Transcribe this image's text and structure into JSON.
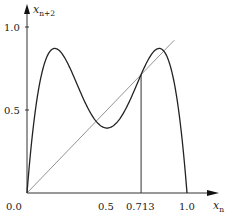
{
  "chart_data": {
    "type": "line",
    "title": "",
    "xlabel": "x_n",
    "ylabel": "x_{n+2}",
    "xlim": [
      0,
      1.1
    ],
    "ylim": [
      0,
      1.05
    ],
    "grid": false,
    "legend": null,
    "x_ticks": [
      {
        "value": 0.0,
        "label": "0.0"
      },
      {
        "value": 0.5,
        "label": "0.5"
      },
      {
        "value": 0.713,
        "label": "0.713"
      },
      {
        "value": 1.0,
        "label": "1.0"
      }
    ],
    "y_ticks": [
      {
        "value": 0.5,
        "label": "0.5"
      },
      {
        "value": 1.0,
        "label": "1.0"
      }
    ],
    "series": [
      {
        "name": "second iterate f(f(x_n))",
        "style": "solid-dark",
        "x": [
          0,
          0.05,
          0.1,
          0.15,
          0.2,
          0.25,
          0.3,
          0.35,
          0.4,
          0.45,
          0.5,
          0.55,
          0.6,
          0.65,
          0.7,
          0.75,
          0.8,
          0.85,
          0.9,
          0.95,
          1.0
        ],
        "values": [
          0,
          0.4812,
          0.75,
          0.8603,
          0.8595,
          0.7892,
          0.684,
          0.5725,
          0.4772,
          0.4135,
          0.3915,
          0.4135,
          0.4772,
          0.5725,
          0.684,
          0.7892,
          0.8595,
          0.8603,
          0.75,
          0.4812,
          0
        ]
      },
      {
        "name": "diagonal x_{n+2} = x_n",
        "style": "thin-gray",
        "x": [
          0,
          0.92
        ],
        "values": [
          0,
          0.92
        ]
      }
    ],
    "annotations": [
      {
        "type": "vertical-line",
        "x": 0.713,
        "from_y": 0,
        "to_y": 0.713,
        "label": "0.713"
      }
    ],
    "parameter_r": 3.4843
  },
  "labels": {
    "y_axis_main": "x",
    "y_axis_sub": "n+2",
    "x_axis_main": "x",
    "x_axis_sub": "n",
    "origin": "0.0",
    "x_tick_05": "0.5",
    "x_tick_0713": "0.713",
    "x_tick_10": "1.0",
    "y_tick_05": "0.5",
    "y_tick_10": "1.0"
  }
}
